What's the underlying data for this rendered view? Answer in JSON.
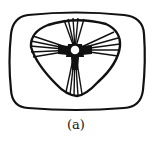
{
  "figure": {
    "caption": "(a)",
    "ink_color": "#111111",
    "background": "#ffffff",
    "outer_shape": "rounded-rectangle",
    "inner_shape": "rounded-triangle",
    "center": "small white circle",
    "spoke_bundles": [
      {
        "direction": "up",
        "count": 5
      },
      {
        "direction": "left",
        "count": 5
      },
      {
        "direction": "right",
        "count": 5
      },
      {
        "direction": "down",
        "count": 5
      }
    ]
  }
}
